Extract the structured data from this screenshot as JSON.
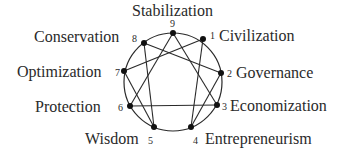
{
  "diagram": {
    "type": "enneagram",
    "nodes": [
      {
        "id": 1,
        "number": "1",
        "label": "Civilization"
      },
      {
        "id": 2,
        "number": "2",
        "label": "Governance"
      },
      {
        "id": 3,
        "number": "3",
        "label": "Economization"
      },
      {
        "id": 4,
        "number": "4",
        "label": "Entrepreneurism"
      },
      {
        "id": 5,
        "number": "5",
        "label": "Wisdom"
      },
      {
        "id": 6,
        "number": "6",
        "label": "Protection"
      },
      {
        "id": 7,
        "number": "7",
        "label": "Optimization"
      },
      {
        "id": 8,
        "number": "8",
        "label": "Conservation"
      },
      {
        "id": 9,
        "number": "9",
        "label": "Stabilization"
      }
    ],
    "edges": [
      [
        9,
        3
      ],
      [
        3,
        6
      ],
      [
        6,
        9
      ],
      [
        1,
        4
      ],
      [
        4,
        2
      ],
      [
        2,
        8
      ],
      [
        8,
        5
      ],
      [
        5,
        7
      ],
      [
        7,
        1
      ]
    ],
    "colors": {
      "line": "#2a2a2a",
      "node": "#111111",
      "text": "#2a2a2a"
    }
  }
}
